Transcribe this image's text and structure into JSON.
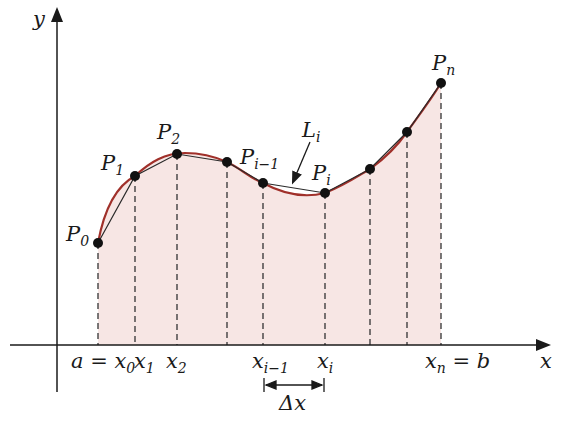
{
  "figure": {
    "axes": {
      "x_label": "x",
      "y_label": "y"
    },
    "points": [
      {
        "name": "P0",
        "label": "P",
        "sub": "0",
        "x": 98,
        "y": 243
      },
      {
        "name": "P1",
        "label": "P",
        "sub": "1",
        "x": 135,
        "y": 176
      },
      {
        "name": "P2",
        "label": "P",
        "sub": "2",
        "x": 177,
        "y": 154
      },
      {
        "name": "P3",
        "label": "",
        "sub": "",
        "x": 227,
        "y": 162
      },
      {
        "name": "Pi-1",
        "label": "P",
        "sub": "i−1",
        "x": 263,
        "y": 183
      },
      {
        "name": "Pi",
        "label": "P",
        "sub": "i",
        "x": 325,
        "y": 193
      },
      {
        "name": "P7",
        "label": "",
        "sub": "",
        "x": 370,
        "y": 169
      },
      {
        "name": "P8",
        "label": "",
        "sub": "",
        "x": 407,
        "y": 132
      },
      {
        "name": "Pn",
        "label": "P",
        "sub": "n",
        "x": 441,
        "y": 83
      }
    ],
    "segment_label": {
      "main": "L",
      "sub": "i"
    },
    "ticks": [
      {
        "main": "a = x",
        "sub": "0"
      },
      {
        "main": "x",
        "sub": "1"
      },
      {
        "main": "x",
        "sub": "2"
      },
      {
        "main": "x",
        "sub": "i−1"
      },
      {
        "main": "x",
        "sub": "i"
      },
      {
        "main": "x",
        "sub": "n",
        "suffix": " = b"
      }
    ],
    "delta_label": "Δx",
    "colors": {
      "curve": "#a0302a",
      "polyline": "#2a2a2a",
      "fill": "#f7e6e4",
      "axis": "#1a1a1a"
    }
  }
}
